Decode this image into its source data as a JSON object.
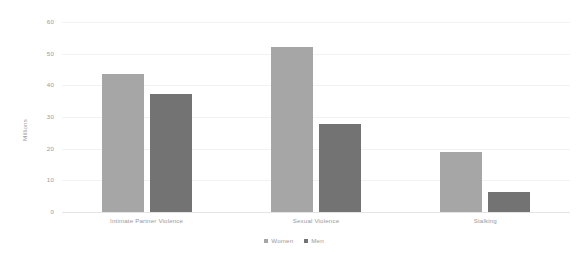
{
  "chart_data": {
    "type": "bar",
    "title": "",
    "subtitle": "",
    "xlabel": "",
    "ylabel": "Millions",
    "ylim": [
      0,
      60
    ],
    "ytick_step": 10,
    "yticks": [
      "60",
      "50",
      "40",
      "30",
      "20",
      "10",
      "0"
    ],
    "grid": true,
    "grid_axis": "y",
    "legend_position": "bottom",
    "categories": [
      "Intimate Partner Violence",
      "Sexual Violence",
      "Stalking"
    ],
    "series": [
      {
        "name": "Women",
        "color": "#a6a6a6",
        "values": [
          43.5,
          52.2,
          18.8
        ]
      },
      {
        "name": "Men",
        "color": "#737373",
        "values": [
          37.3,
          27.7,
          6.3
        ]
      }
    ]
  },
  "style": {
    "background": "#ffffff",
    "axis_text_color": "#9a9a9a",
    "gridline_color": "#f2f2f2",
    "baseline_color": "#e4e4e4"
  }
}
